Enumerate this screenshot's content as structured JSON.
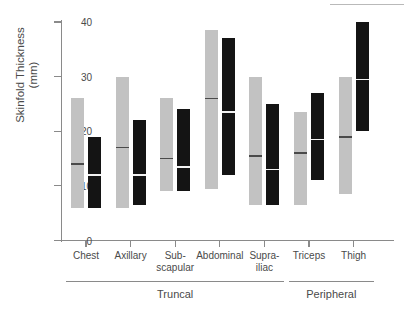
{
  "chart_data": {
    "type": "bar",
    "title": "",
    "subtitle": "",
    "xlabel": "",
    "ylabel_line1": "Skinfold Thickness",
    "ylabel_line2": "(mm)",
    "ylim": [
      0,
      40
    ],
    "yticks": [
      0,
      10,
      20,
      30,
      40
    ],
    "ytick_labels": [
      "0",
      "10",
      "20",
      "30",
      "40"
    ],
    "grid": false,
    "legend_position": "none",
    "legend": [],
    "categories": [
      "Chest",
      "Axillary",
      "Sub-\nscapular",
      "Abdominal",
      "Supra-\niliac",
      "Triceps",
      "Thigh"
    ],
    "category_labels_flat": [
      "Chest",
      "Axillary",
      "Sub-scapular",
      "Abdominal",
      "Supra-iliac",
      "Triceps",
      "Thigh"
    ],
    "groups": [
      {
        "label": "Truncal",
        "categories": [
          "Chest",
          "Axillary",
          "Sub-scapular",
          "Abdominal",
          "Supra-iliac"
        ]
      },
      {
        "label": "Peripheral",
        "categories": [
          "Triceps",
          "Thigh"
        ]
      }
    ],
    "series": [
      {
        "name": "light",
        "color": "#c2c2c2",
        "bars": [
          {
            "category": "Chest",
            "low": 6.0,
            "high": 26.0,
            "median": 14.0
          },
          {
            "category": "Axillary",
            "low": 6.0,
            "high": 30.0,
            "median": 17.0
          },
          {
            "category": "Sub-scapular",
            "low": 9.0,
            "high": 26.0,
            "median": 15.0
          },
          {
            "category": "Abdominal",
            "low": 9.5,
            "high": 38.5,
            "median": 26.0
          },
          {
            "category": "Supra-iliac",
            "low": 6.5,
            "high": 30.0,
            "median": 15.5
          },
          {
            "category": "Triceps",
            "low": 6.5,
            "high": 23.5,
            "median": 16.0
          },
          {
            "category": "Thigh",
            "low": 8.5,
            "high": 30.0,
            "median": 19.0
          }
        ]
      },
      {
        "name": "dark",
        "color": "#141414",
        "bars": [
          {
            "category": "Chest",
            "low": 6.0,
            "high": 19.0,
            "median": 12.0
          },
          {
            "category": "Axillary",
            "low": 6.5,
            "high": 22.0,
            "median": 12.0
          },
          {
            "category": "Sub-scapular",
            "low": 9.0,
            "high": 24.0,
            "median": 13.5
          },
          {
            "category": "Abdominal",
            "low": 12.0,
            "high": 37.0,
            "median": 23.5
          },
          {
            "category": "Supra-iliac",
            "low": 6.5,
            "high": 25.0,
            "median": 13.0
          },
          {
            "category": "Triceps",
            "low": 11.0,
            "high": 27.0,
            "median": 18.5
          },
          {
            "category": "Thigh",
            "low": 20.0,
            "high": 40.0,
            "median": 29.5
          }
        ]
      }
    ]
  }
}
